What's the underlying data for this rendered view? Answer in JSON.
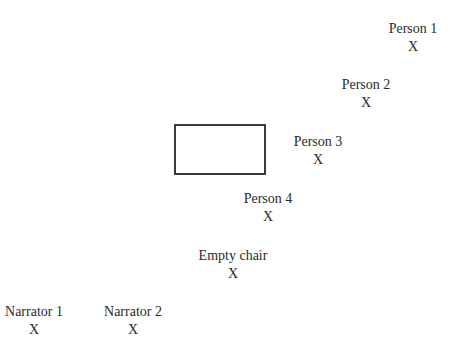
{
  "diagram": {
    "marker": "X",
    "positions": [
      {
        "label": "Person 1",
        "x": 413,
        "y": 20
      },
      {
        "label": "Person 2",
        "x": 366,
        "y": 76
      },
      {
        "label": "Person 3",
        "x": 318,
        "y": 133
      },
      {
        "label": "Person 4",
        "x": 268,
        "y": 190
      },
      {
        "label": "Empty chair",
        "x": 233,
        "y": 247
      },
      {
        "label": "Narrator 1",
        "x": 34,
        "y": 303
      },
      {
        "label": "Narrator 2",
        "x": 133,
        "y": 303
      }
    ],
    "table": {
      "label": ""
    }
  }
}
